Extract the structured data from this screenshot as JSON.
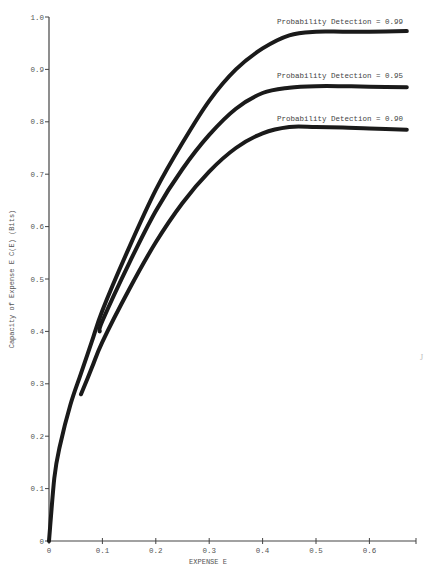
{
  "chart_data": {
    "type": "line",
    "title": "",
    "xlabel": "EXPENSE E",
    "ylabel": "Capacity of Expense E C(E) (Bits)",
    "xlim": [
      0,
      0.67
    ],
    "ylim": [
      0,
      1.0
    ],
    "x_ticks": [
      "0",
      "0.1",
      "0.2",
      "0.3",
      "0.4",
      "0.5",
      "0.6"
    ],
    "y_ticks": [
      "0",
      "0.1",
      "0.2",
      "0.3",
      "0.4",
      "0.5",
      "0.6",
      "0.7",
      "0.8",
      "0.9",
      "1.0"
    ],
    "grid": false,
    "legend": "inline labels at upper right above each curve",
    "series": [
      {
        "name": "Probability Detection = 0.99",
        "x": [
          0,
          0.01,
          0.02,
          0.04,
          0.06,
          0.08,
          0.1,
          0.15,
          0.2,
          0.25,
          0.3,
          0.35,
          0.4,
          0.45,
          0.5,
          0.55,
          0.6,
          0.67
        ],
        "y": [
          0,
          0.12,
          0.18,
          0.26,
          0.32,
          0.38,
          0.44,
          0.56,
          0.67,
          0.76,
          0.84,
          0.9,
          0.94,
          0.965,
          0.972,
          0.972,
          0.972,
          0.973
        ]
      },
      {
        "name": "Probability Detection = 0.95",
        "x": [
          0.095,
          0.1,
          0.15,
          0.2,
          0.25,
          0.3,
          0.35,
          0.4,
          0.45,
          0.5,
          0.55,
          0.6,
          0.67
        ],
        "y": [
          0.4,
          0.42,
          0.53,
          0.63,
          0.71,
          0.775,
          0.825,
          0.855,
          0.865,
          0.868,
          0.868,
          0.867,
          0.866
        ]
      },
      {
        "name": "Probability Detection = 0.90",
        "x": [
          0.06,
          0.08,
          0.1,
          0.15,
          0.2,
          0.25,
          0.3,
          0.35,
          0.4,
          0.45,
          0.5,
          0.55,
          0.6,
          0.67
        ],
        "y": [
          0.28,
          0.33,
          0.38,
          0.48,
          0.57,
          0.645,
          0.705,
          0.75,
          0.778,
          0.79,
          0.79,
          0.789,
          0.787,
          0.785
        ]
      }
    ],
    "annotations": [
      "Probability Detection = 0.99",
      "Probability Detection = 0.95",
      "Probability Detection = 0.90"
    ]
  },
  "labels": {
    "xlabel": "EXPENSE E",
    "ylabel": "Capacity of Expense E C(E) (Bits)",
    "series_099": "Probability Detection = 0.99",
    "series_095": "Probability Detection = 0.95",
    "series_090": "Probability Detection = 0.90",
    "stray_mark": "J"
  },
  "colors": {
    "curve": "#1a1a1a",
    "axis": "#444444",
    "text": "#555555",
    "background": "#ffffff"
  }
}
